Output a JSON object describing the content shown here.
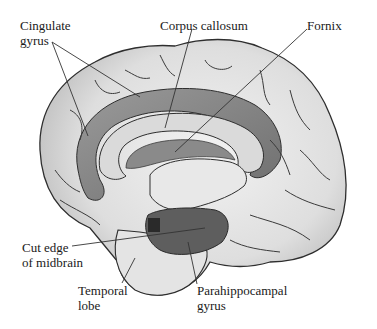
{
  "figure": {
    "labels": {
      "cingulate_gyrus": {
        "line1": "Cingulate",
        "line2": "gyrus"
      },
      "corpus_callosum": {
        "line1": "Corpus callosum"
      },
      "fornix": {
        "line1": "Fornix"
      },
      "cut_edge_midbrain": {
        "line1": "Cut edge",
        "line2": "of midbrain"
      },
      "temporal_lobe": {
        "line1": "Temporal",
        "line2": "lobe"
      },
      "parahippocampal_gyrus": {
        "line1": "Parahippocampal",
        "line2": "gyrus"
      }
    },
    "colors": {
      "cortex_light": "#e6e6e6",
      "cortex_mid": "#c8c8c8",
      "limbic_dark": "#8c8c8c",
      "callosum": "#dcdcdc",
      "sulcus_line": "#3a3a3a",
      "leader_line": "#333333"
    }
  }
}
